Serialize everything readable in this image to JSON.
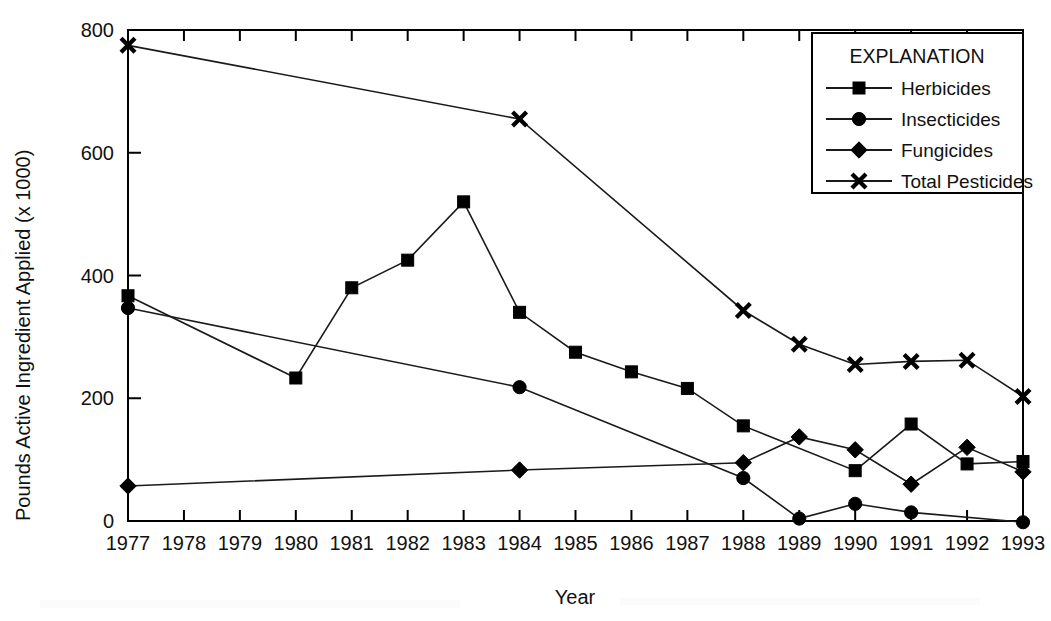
{
  "chart_data": {
    "type": "line",
    "title": "",
    "subtitle": "",
    "xlabel": "Year",
    "ylabel": "Pounds Active Ingredient Applied (x 1000)",
    "x": [
      1977,
      1978,
      1979,
      1980,
      1981,
      1982,
      1983,
      1984,
      1985,
      1986,
      1987,
      1988,
      1989,
      1990,
      1991,
      1992,
      1993
    ],
    "categories": [
      "1977",
      "1978",
      "1979",
      "1980",
      "1981",
      "1982",
      "1983",
      "1984",
      "1985",
      "1986",
      "1987",
      "1988",
      "1989",
      "1990",
      "1991",
      "1992",
      "1993"
    ],
    "xlim": [
      1977,
      1993
    ],
    "ylim": [
      0,
      800
    ],
    "yticks": [
      0,
      200,
      400,
      600,
      800
    ],
    "ytick_labels": [
      "0",
      "200",
      "400",
      "600",
      "800"
    ],
    "grid": false,
    "legend_position": "top-right",
    "legend_title": "EXPLANATION",
    "series": [
      {
        "name": "Herbicides",
        "marker": "square",
        "x": [
          1977,
          1980,
          1981,
          1982,
          1983,
          1984,
          1985,
          1986,
          1987,
          1988,
          1990,
          1991,
          1992,
          1993
        ],
        "values": [
          367,
          233,
          380,
          425,
          520,
          340,
          275,
          243,
          216,
          155,
          82,
          158,
          93,
          97
        ]
      },
      {
        "name": "Insecticides",
        "marker": "circle",
        "x": [
          1977,
          1984,
          1988,
          1989,
          1990,
          1991,
          1993
        ],
        "values": [
          347,
          218,
          70,
          4,
          28,
          14,
          -2
        ]
      },
      {
        "name": "Fungicides",
        "marker": "diamond",
        "x": [
          1977,
          1984,
          1988,
          1989,
          1990,
          1991,
          1992,
          1993
        ],
        "values": [
          57,
          83,
          95,
          137,
          116,
          60,
          120,
          80
        ]
      },
      {
        "name": "Total Pesticides",
        "marker": "x",
        "x": [
          1977,
          1984,
          1988,
          1989,
          1990,
          1991,
          1992,
          1993
        ],
        "values": [
          775,
          655,
          343,
          288,
          255,
          260,
          262,
          203
        ]
      }
    ]
  }
}
